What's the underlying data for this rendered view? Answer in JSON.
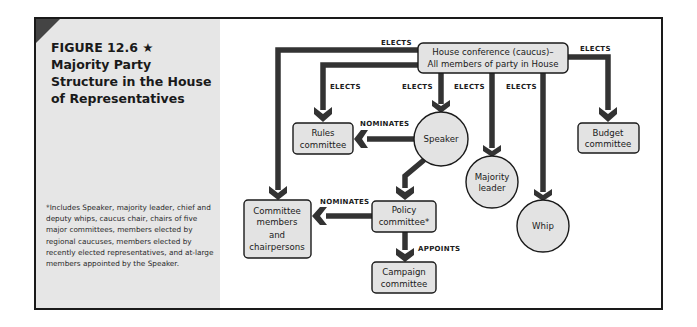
{
  "figure": {
    "number": "FIGURE 12.6 ★",
    "title_lines": [
      "Majority Party",
      "Structure in the House",
      "of Representatives"
    ],
    "footnote": "*Includes Speaker, majority leader, chief and deputy whips, caucus chair, chairs of five major committees, members elected by regional caucuses, members elected by recently elected representatives, and at-large members appointed by the Speaker."
  },
  "colors": {
    "node_fill": "#e3e3e3",
    "node_stroke": "#1a1a1a",
    "arrow": "#333333",
    "side_panel": "#e6e6e6"
  },
  "nodes": {
    "conference": {
      "lines": [
        "House conference (caucus)–",
        "All members of party in House"
      ],
      "shape": "rounded-rect"
    },
    "rules": {
      "lines": [
        "Rules",
        "committee"
      ],
      "shape": "rounded-rect"
    },
    "speaker": {
      "lines": [
        "Speaker"
      ],
      "shape": "circle"
    },
    "majority_leader": {
      "lines": [
        "Majority",
        "leader"
      ],
      "shape": "circle"
    },
    "whip": {
      "lines": [
        "Whip"
      ],
      "shape": "circle"
    },
    "budget": {
      "lines": [
        "Budget",
        "committee"
      ],
      "shape": "rounded-rect"
    },
    "committee_members": {
      "lines": [
        "Committee",
        "members",
        "and",
        "chairpersons"
      ],
      "shape": "rounded-rect"
    },
    "policy": {
      "lines": [
        "Policy",
        "committee*"
      ],
      "shape": "rounded-rect"
    },
    "campaign": {
      "lines": [
        "Campaign",
        "committee"
      ],
      "shape": "rounded-rect"
    }
  },
  "edges": [
    {
      "from": "conference",
      "to": "committee_members",
      "label": "ELECTS"
    },
    {
      "from": "conference",
      "to": "rules",
      "label": "ELECTS"
    },
    {
      "from": "conference",
      "to": "speaker",
      "label": "ELECTS"
    },
    {
      "from": "conference",
      "to": "majority_leader",
      "label": "ELECTS"
    },
    {
      "from": "conference",
      "to": "whip",
      "label": "ELECTS"
    },
    {
      "from": "conference",
      "to": "budget",
      "label": "ELECTS"
    },
    {
      "from": "speaker",
      "to": "rules",
      "label": "NOMINATES"
    },
    {
      "from": "speaker",
      "to": "policy",
      "label": ""
    },
    {
      "from": "policy",
      "to": "committee_members",
      "label": "NOMINATES"
    },
    {
      "from": "policy",
      "to": "campaign",
      "label": "APPOINTS"
    }
  ]
}
